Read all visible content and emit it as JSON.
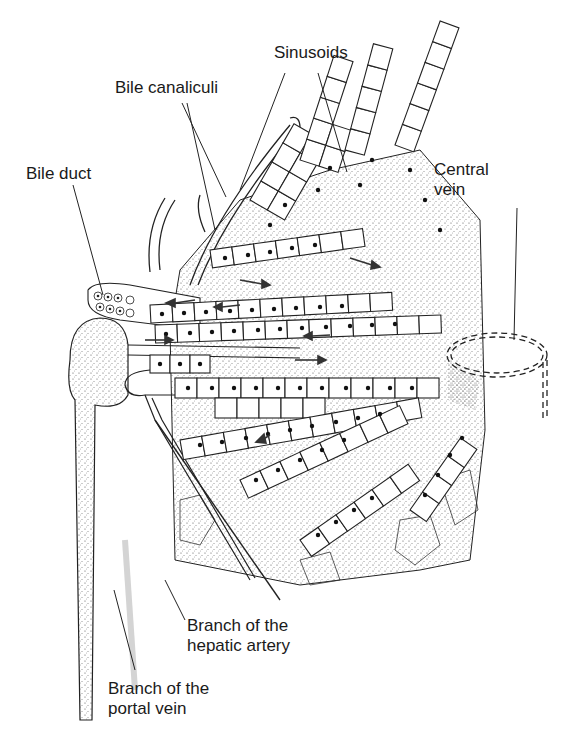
{
  "diagram": {
    "labels": {
      "sinusoids": "Sinusoids",
      "bile_canaliculi": "Bile canaliculi",
      "bile_duct": "Bile duct",
      "central_vein": "Central\nvein",
      "hepatic_artery": "Branch of the\nhepatic artery",
      "portal_vein": "Branch of the\nportal vein"
    },
    "colors": {
      "line": "#1a1a1a",
      "stipple": "#8a8a8a",
      "background": "#ffffff"
    }
  }
}
